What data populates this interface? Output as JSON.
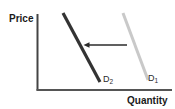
{
  "chart_data": {
    "type": "line",
    "title": "",
    "xlabel": "Quantity",
    "ylabel": "Price",
    "grid": false,
    "legend": "none",
    "annotation_description": "Leftward horizontal arrow indicating a decrease in demand (shift from D1 to D2)",
    "series": [
      {
        "name": "D1",
        "label": "D",
        "subscript": "1",
        "color": "#c9c9c9",
        "description": "Original demand curve, downward sloping, positioned right",
        "x": [
          123,
          148
        ],
        "y": [
          13,
          80
        ],
        "start_point": {
          "x": 123,
          "y": 13
        },
        "end_point": {
          "x": 148,
          "y": 80
        }
      },
      {
        "name": "D2",
        "label": "D",
        "subscript": "2",
        "color": "#333333",
        "description": "New demand curve after leftward shift, downward sloping, positioned left",
        "x": [
          63,
          100
        ],
        "y": [
          13,
          82
        ],
        "start_point": {
          "x": 63,
          "y": 13
        },
        "end_point": {
          "x": 100,
          "y": 82
        }
      }
    ],
    "axes": {
      "y_axis": {
        "x": 37,
        "y_top": 14,
        "y_bottom": 90,
        "color": "#444444"
      },
      "x_axis": {
        "y": 90,
        "x_left": 37,
        "x_right": 172,
        "color": "#555555"
      }
    },
    "arrow": {
      "from_x": 127,
      "to_x": 84,
      "y": 45,
      "direction": "left",
      "color": "#2b2b2b"
    }
  },
  "axis_labels": {
    "y": "Price",
    "x": "Quantity"
  },
  "curve_labels": {
    "d2": {
      "base": "D",
      "sub": "2"
    },
    "d1": {
      "base": "D",
      "sub": "1"
    }
  },
  "colors": {
    "background": "#ffffff",
    "axis": "#4a4a4a",
    "curve_new": "#333333",
    "curve_original": "#c9c9c9",
    "arrow": "#2b2b2b",
    "text": "#1a1a1a"
  }
}
